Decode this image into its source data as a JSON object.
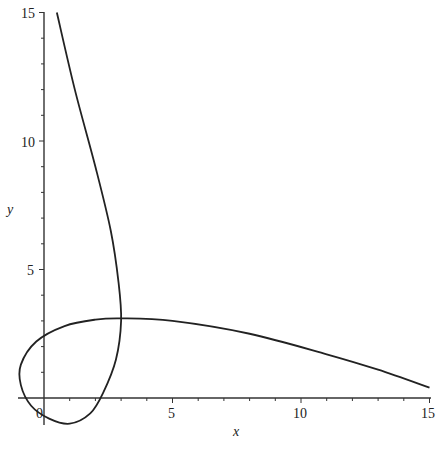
{
  "chart_data": {
    "type": "line",
    "title": "",
    "xlabel": "x",
    "ylabel": "y",
    "xlim": [
      -1,
      15
    ],
    "ylim": [
      -1,
      15
    ],
    "grid": false,
    "legend": null,
    "x_ticks": [
      "0",
      "5",
      "10",
      "15"
    ],
    "y_ticks": [
      "5",
      "10",
      "15"
    ],
    "series": [
      {
        "name": "parametric curve",
        "color": "#222222",
        "points": [
          [
            0.5,
            15
          ],
          [
            1.2,
            12
          ],
          [
            2.0,
            9
          ],
          [
            2.6,
            6.5
          ],
          [
            2.9,
            4.5
          ],
          [
            3.0,
            3.0
          ],
          [
            2.8,
            1.5
          ],
          [
            2.3,
            0.2
          ],
          [
            1.8,
            -0.6
          ],
          [
            1.0,
            -1.0
          ],
          [
            0.2,
            -0.8
          ],
          [
            -0.5,
            -0.3
          ],
          [
            -0.9,
            0.5
          ],
          [
            -0.9,
            1.3
          ],
          [
            -0.3,
            2.2
          ],
          [
            0.8,
            2.8
          ],
          [
            2.0,
            3.05
          ],
          [
            3.0,
            3.1
          ],
          [
            5.0,
            3.0
          ],
          [
            8.0,
            2.5
          ],
          [
            11.0,
            1.7
          ],
          [
            13.0,
            1.1
          ],
          [
            15.0,
            0.4
          ]
        ]
      }
    ]
  },
  "axes": {
    "x_label": "x",
    "y_label": "y",
    "x_tick_labels": [
      "0",
      "5",
      "10",
      "15"
    ],
    "y_tick_labels": [
      "5",
      "10",
      "15"
    ]
  }
}
